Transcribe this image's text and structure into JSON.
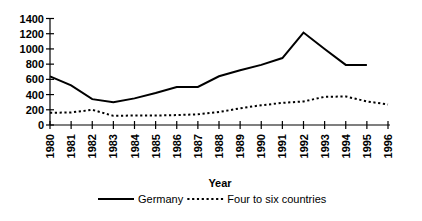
{
  "chart_data": {
    "type": "line",
    "title": "",
    "xlabel": "Year",
    "ylabel": "",
    "categories": [
      "1980",
      "1981",
      "1982",
      "1983",
      "1984",
      "1985",
      "1986",
      "1987",
      "1988",
      "1989",
      "1990",
      "1991",
      "1992",
      "1993",
      "1994",
      "1995",
      "1996"
    ],
    "ylim": [
      0,
      1400
    ],
    "ytick_step": 200,
    "yticks": [
      "0",
      "200",
      "400",
      "600",
      "800",
      "1000",
      "1200",
      "1400"
    ],
    "grid": false,
    "legend_position": "bottom",
    "series": [
      {
        "name": "Germany",
        "style": "solid",
        "values": [
          640,
          520,
          340,
          300,
          350,
          420,
          500,
          500,
          640,
          720,
          790,
          880,
          1215,
          1000,
          790,
          790,
          null
        ]
      },
      {
        "name": "Four to six countries",
        "style": "dotted",
        "values": [
          160,
          165,
          200,
          120,
          125,
          125,
          130,
          140,
          170,
          220,
          260,
          290,
          310,
          370,
          375,
          310,
          270
        ]
      }
    ]
  },
  "axis": {
    "x_title": "Year"
  },
  "legend": {
    "items": [
      {
        "label": "Germany",
        "style": "solid"
      },
      {
        "label": "Four to six countries",
        "style": "dotted"
      }
    ]
  }
}
